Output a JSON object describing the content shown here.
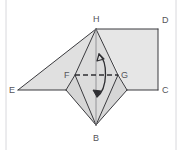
{
  "figure": {
    "type": "geometry-diagram",
    "background_color": "#ffffff",
    "stroke_color": "#3a3a3e",
    "label_color": "#55555a",
    "fill_light": "#e6e6e6",
    "fill_mid": "#dedede",
    "fill_dark": "#d4d4d4",
    "page_rule_color": "#d8d8dc",
    "labels": [
      {
        "id": "H",
        "text": "H",
        "x": 93,
        "y": 22,
        "role": "apex-top"
      },
      {
        "id": "D",
        "text": "D",
        "x": 162,
        "y": 23,
        "role": "rect-top-right"
      },
      {
        "id": "E",
        "text": "E",
        "x": 9,
        "y": 93,
        "role": "left-apex"
      },
      {
        "id": "F",
        "text": "F",
        "x": 64,
        "y": 78,
        "role": "axis-left"
      },
      {
        "id": "G",
        "text": "G",
        "x": 121,
        "y": 78,
        "role": "axis-right"
      },
      {
        "id": "C",
        "text": "C",
        "x": 162,
        "y": 93,
        "role": "rect-bottom-right"
      },
      {
        "id": "B",
        "text": "B",
        "x": 93,
        "y": 141,
        "role": "apex-bottom"
      }
    ],
    "points": {
      "H": {
        "x": 96,
        "y": 29
      },
      "D": {
        "x": 158,
        "y": 29
      },
      "C": {
        "x": 158,
        "y": 90
      },
      "E": {
        "x": 18,
        "y": 90
      },
      "F": {
        "x": 75,
        "y": 75
      },
      "G": {
        "x": 118,
        "y": 75
      },
      "B": {
        "x": 96,
        "y": 125
      },
      "L1": {
        "x": 66,
        "y": 90
      },
      "R1": {
        "x": 127,
        "y": 90
      }
    },
    "faces": [
      {
        "name": "rectangle-HDCB-side",
        "vertices": "H,D,C,R1",
        "fill": "#e6e6e6"
      },
      {
        "name": "left-triangle-EHF",
        "vertices": "E,H,F,L1",
        "fill": "#e0e0e0"
      },
      {
        "name": "upper-left-face-FHB",
        "vertices": "F,H,B",
        "fill": "#dcdcdc"
      },
      {
        "name": "upper-right-face-GHB",
        "vertices": "G,H,B",
        "fill": "#dcdcdc"
      },
      {
        "name": "lower-left-face",
        "vertices": "F,L1,B",
        "fill": "#d6d6d6"
      },
      {
        "name": "lower-right-face",
        "vertices": "G,R1,B",
        "fill": "#d6d6d6"
      }
    ],
    "edges": [
      {
        "name": "edge-H-D",
        "from": "H",
        "to": "D"
      },
      {
        "name": "edge-D-C",
        "from": "D",
        "to": "C"
      },
      {
        "name": "edge-C-R1",
        "from": "C",
        "to": "R1"
      },
      {
        "name": "edge-H-E",
        "from": "H",
        "to": "E"
      },
      {
        "name": "edge-E-L1",
        "from": "E",
        "to": "L1"
      },
      {
        "name": "edge-H-B",
        "from": "H",
        "to": "B"
      },
      {
        "name": "edge-H-F",
        "from": "H",
        "to": "F"
      },
      {
        "name": "edge-H-G",
        "from": "H",
        "to": "G"
      },
      {
        "name": "edge-F-B",
        "from": "F",
        "to": "B"
      },
      {
        "name": "edge-G-B",
        "from": "G",
        "to": "B"
      },
      {
        "name": "edge-F-L1",
        "from": "F",
        "to": "L1"
      },
      {
        "name": "edge-G-R1",
        "from": "G",
        "to": "R1"
      },
      {
        "name": "edge-L1-B",
        "from": "L1",
        "to": "B"
      },
      {
        "name": "edge-R1-B",
        "from": "R1",
        "to": "B"
      }
    ],
    "axis": {
      "name": "axis-FG",
      "from": "F",
      "to": "G",
      "style": "dashed",
      "dash_pattern": "5,3"
    },
    "rotation_arrow": {
      "name": "rotation-arrow",
      "description": "double-headed curved arrow indicating rotation about FG",
      "double_headed": true
    },
    "page_rules": [
      {
        "name": "page-rule-left",
        "x": 6,
        "y1": 0,
        "y2": 150
      },
      {
        "name": "page-rule-right",
        "x": 176,
        "y1": 0,
        "y2": 150
      }
    ]
  }
}
